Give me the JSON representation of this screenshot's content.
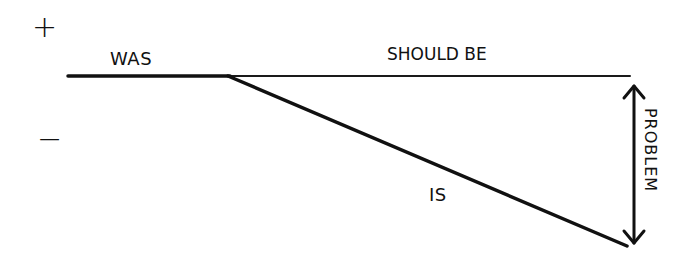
{
  "diagram": {
    "type": "problem-definition-gap-diagram",
    "axis_markers": {
      "positive": "+",
      "negative": "−"
    },
    "labels": {
      "was": "WAS",
      "should_be": "SHOULD BE",
      "is": "IS",
      "problem": "PROBLEM"
    },
    "lines": {
      "baseline": {
        "x1": 68,
        "y1": 76,
        "x2": 630,
        "y2": 76,
        "meaning": "SHOULD BE"
      },
      "was_segment": {
        "x1": 68,
        "y1": 76,
        "x2": 228,
        "y2": 76,
        "meaning": "WAS"
      },
      "decline": {
        "x1": 228,
        "y1": 76,
        "x2": 627,
        "y2": 246,
        "meaning": "IS"
      },
      "gap_arrow": {
        "x": 634,
        "y1": 84,
        "y2": 245,
        "meaning": "PROBLEM",
        "double_headed": true
      }
    },
    "stroke_color": "#111111",
    "background_color": "#ffffff"
  }
}
